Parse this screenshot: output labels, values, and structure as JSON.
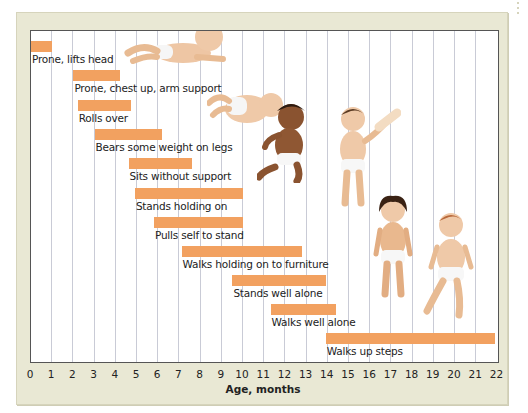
{
  "chart_data": {
    "type": "bar",
    "orientation": "horizontal-range",
    "title": "",
    "xlabel": "Age, months",
    "ylabel": "",
    "xlim": [
      0,
      22
    ],
    "xticks": [
      "0",
      "1",
      "2",
      "3",
      "4",
      "5",
      "6",
      "7",
      "8",
      "9",
      "10",
      "11",
      "12",
      "13",
      "14",
      "15",
      "16",
      "17",
      "18",
      "19",
      "20",
      "21",
      "22"
    ],
    "grid": "vertical lines at each month",
    "legend": null,
    "bar_color": "#f2a160",
    "milestones": [
      {
        "label": "Prone, lifts head",
        "start": 0,
        "end": 1
      },
      {
        "label": "Prone, chest up, arm support",
        "start": 2,
        "end": 4.2
      },
      {
        "label": "Rolls over",
        "start": 2.2,
        "end": 4.7
      },
      {
        "label": "Bears some weight on legs",
        "start": 3,
        "end": 6.2
      },
      {
        "label": "Sits without support",
        "start": 4.6,
        "end": 7.6
      },
      {
        "label": "Stands holding on",
        "start": 4.9,
        "end": 10
      },
      {
        "label": "Pulls self to stand",
        "start": 5.8,
        "end": 10
      },
      {
        "label": "Walks holding on to furniture",
        "start": 7.1,
        "end": 12.8
      },
      {
        "label": "Stands well alone",
        "start": 9.5,
        "end": 13.9
      },
      {
        "label": "Walks well alone",
        "start": 11.3,
        "end": 14.4
      },
      {
        "label": "Walks up steps",
        "start": 13.9,
        "end": 21.9
      }
    ]
  },
  "illustrations": [
    "baby-prone-lifting-head-icon",
    "baby-rolling-over-icon",
    "baby-sitting-icon",
    "baby-standing-holding-on-icon",
    "baby-standing-alone-icon",
    "baby-walking-icon"
  ]
}
